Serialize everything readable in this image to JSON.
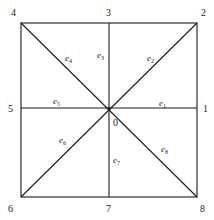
{
  "diagram": {
    "type": "square mesh with 8 radial elements",
    "center_label": "0",
    "node_labels": {
      "n1": "1",
      "n2": "2",
      "n3": "3",
      "n4": "4",
      "n5": "5",
      "n6": "6",
      "n7": "7",
      "n8": "8"
    },
    "element_labels": {
      "e1": {
        "base": "e",
        "sub": "1"
      },
      "e2": {
        "base": "e",
        "sub": "2"
      },
      "e3": {
        "base": "e",
        "sub": "3"
      },
      "e4": {
        "base": "e",
        "sub": "4"
      },
      "e5": {
        "base": "e",
        "sub": "5"
      },
      "e6": {
        "base": "e",
        "sub": "6"
      },
      "e7": {
        "base": "e",
        "sub": "7"
      },
      "e8": {
        "base": "e",
        "sub": "8"
      }
    },
    "line_color": "#1a1a1a"
  }
}
